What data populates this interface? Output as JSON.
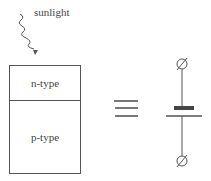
{
  "diagram": {
    "sunlight_label": "sunlight",
    "layers": [
      {
        "label": "n-type"
      },
      {
        "label": "p-type"
      }
    ],
    "equivalence_symbol": "equivalent-sign",
    "circuit_symbol": "battery-cell",
    "terminals": [
      "top-terminal",
      "bottom-terminal"
    ],
    "colors": {
      "stroke": "#555555",
      "text": "#444444",
      "background": "#ffffff"
    }
  }
}
